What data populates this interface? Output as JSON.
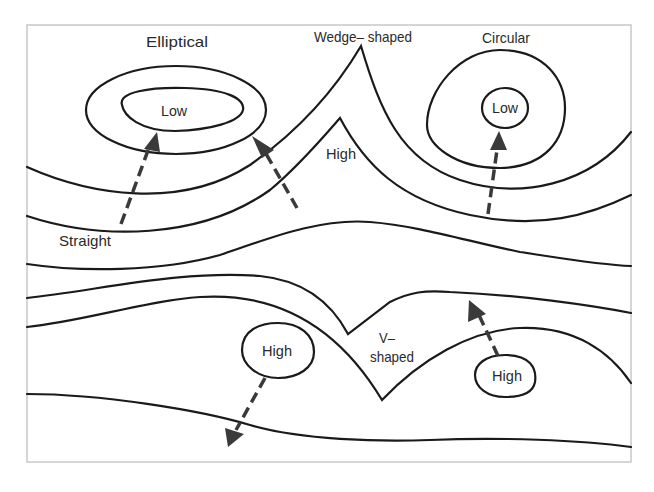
{
  "diagram": {
    "colors": {
      "line": "#1a1a1a",
      "arrow": "#3a3a3a",
      "frame": "#c8c8c8",
      "background": "#ffffff"
    },
    "labels": {
      "elliptical": "Elliptical",
      "wedge_shaped": "Wedge– shaped",
      "circular": "Circular",
      "high_center": "High",
      "straight": "Straight",
      "v_shaped_line1": "V–",
      "v_shaped_line2": "shaped"
    },
    "pressure_centers": [
      {
        "label": "Low",
        "shape": "elliptical"
      },
      {
        "label": "Low",
        "shape": "circular"
      },
      {
        "label": "High",
        "shape": "closed"
      },
      {
        "label": "High",
        "shape": "closed"
      }
    ],
    "arrows": [
      {
        "from": "Straight",
        "to": "Elliptical Low",
        "direction": "up-right"
      },
      {
        "from": "center",
        "to": "Elliptical Low",
        "direction": "up-left"
      },
      {
        "from": "center",
        "to": "Circular Low",
        "direction": "up"
      },
      {
        "from": "High (left)",
        "to": "bottom",
        "direction": "down-left"
      },
      {
        "from": "High (right)",
        "to": "V-shaped trough line",
        "direction": "up-left"
      }
    ]
  }
}
